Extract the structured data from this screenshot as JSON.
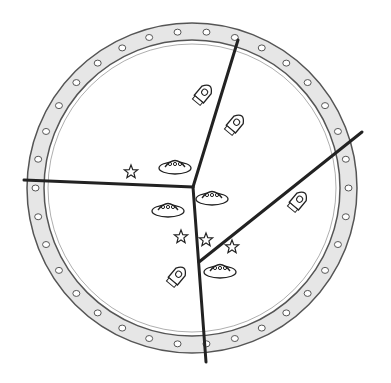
{
  "scene": {
    "description": "Pencil sketch of a circular porthole divided into four regions by dark lines, containing rockets, flying saucers and stars",
    "porthole": {
      "cx": 192,
      "cy": 188,
      "r_outer": 165,
      "r_inner": 148,
      "rivet_count": 34
    },
    "dividers": [
      {
        "from": [
          193,
          187
        ],
        "to": [
          238,
          40
        ]
      },
      {
        "from": [
          193,
          187
        ],
        "to": [
          24,
          180
        ]
      },
      {
        "from": [
          199,
          262
        ],
        "to": [
          362,
          132
        ]
      },
      {
        "from": [
          193,
          187
        ],
        "to": [
          206,
          362
        ]
      }
    ],
    "objects": [
      {
        "type": "rocket",
        "x": 204,
        "y": 93
      },
      {
        "type": "rocket",
        "x": 236,
        "y": 123
      },
      {
        "type": "rocket",
        "x": 299,
        "y": 200
      },
      {
        "type": "rocket",
        "x": 178,
        "y": 275
      },
      {
        "type": "saucer",
        "x": 175,
        "y": 166
      },
      {
        "type": "saucer",
        "x": 168,
        "y": 209
      },
      {
        "type": "saucer",
        "x": 212,
        "y": 197
      },
      {
        "type": "saucer",
        "x": 220,
        "y": 270
      },
      {
        "type": "star",
        "x": 131,
        "y": 172
      },
      {
        "type": "star",
        "x": 181,
        "y": 237
      },
      {
        "type": "star",
        "x": 206,
        "y": 240
      },
      {
        "type": "star",
        "x": 232,
        "y": 247
      }
    ],
    "colors": {
      "line": "#222222",
      "pencil": "#555555",
      "shade": "#bbbbbb"
    }
  }
}
